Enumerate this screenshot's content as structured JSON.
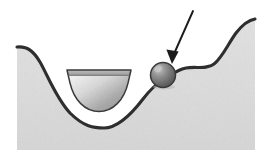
{
  "figure": {
    "title": "Potential energy landscape with ball on ledge",
    "canvas": {
      "width": 268,
      "height": 161,
      "background": "#ffffff"
    },
    "colors": {
      "terrain_fill": "#dcdcdc",
      "terrain_fill_light": "#e6e6e6",
      "terrain_outline": "#2e2e2e",
      "bowl_fill_light": "#f0f0f0",
      "bowl_fill_dark": "#9e9e9e",
      "bowl_outline": "#3a3a3a",
      "ball_light": "#b0b0b0",
      "ball_dark": "#5a5a5a",
      "ball_outline": "#3a3a3a",
      "arrow": "#1a1a1a",
      "white": "#ffffff"
    },
    "elements": [
      {
        "id": "terrain",
        "name": "terrain-landscape",
        "label": "Terrain cross-section",
        "outline_width": 3.2,
        "path": "M 17 47 C 28 46 34 52 40 62 C 48 76 56 98 70 113 C 84 127 94 128 104 128 C 116 128 130 116 143 99 C 150 90 156 84 163 80 C 170 76 176 70 186 68 C 196 66 206 70 214 64 C 222 58 228 44 236 33 C 243 24 249 20 255 19 L 255 150 L 17 150 Z"
      },
      {
        "id": "bowl",
        "name": "bowl-depression",
        "label": "Semicircular bowl (local minimum well)",
        "rim_y": 70,
        "left_x": 67,
        "right_x": 131,
        "bottom_y": 111,
        "outline_width": 1.6,
        "path": "M 67 70 L 131 70 L 128 82 C 124 99 113 111 99 111 C 85 111 74 99 70 82 Z"
      },
      {
        "id": "ball",
        "name": "ball-sphere",
        "label": "Ball resting on ledge (metastable state)",
        "cx": 163,
        "cy": 75,
        "r": 12.5,
        "outline_width": 1.6,
        "highlight_cx": 158,
        "highlight_cy": 69
      },
      {
        "id": "arrow",
        "name": "pointer-arrow",
        "label": "Arrow pointing at the ball",
        "from_x": 193,
        "from_y": 11,
        "to_x": 173,
        "to_y": 58,
        "tip_x": 172,
        "tip_y": 64,
        "shaft_width": 1.8,
        "head_half_width": 5.5,
        "head_length": 14
      }
    ]
  }
}
